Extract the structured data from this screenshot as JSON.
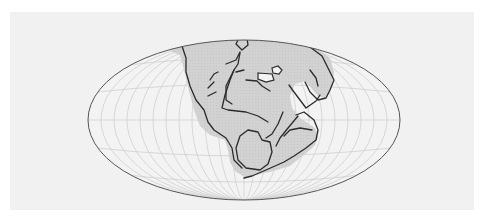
{
  "map": {
    "type": "world-map-projection",
    "projection": "mollweide-ellipse",
    "subject": "supercontinent-pangaea",
    "colors": {
      "page_background": "#ffffff",
      "panel_background": "#f1f1f1",
      "ocean_fill": "#f3f3f3",
      "land_fill": "#d2d2d2",
      "graticule": "#cfcfcf",
      "coastline": "#2a2a2a",
      "outline": "#555555"
    },
    "ellipse": {
      "cx": 244,
      "cy": 120,
      "rx": 156,
      "ry": 80
    },
    "graticule": {
      "meridians": 12,
      "parallels": 5
    },
    "labels": []
  }
}
